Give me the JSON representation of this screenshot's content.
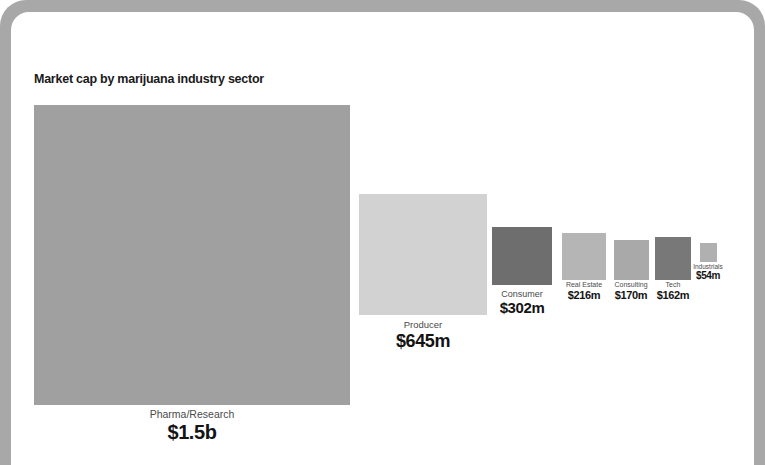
{
  "chart_data": {
    "type": "treemap",
    "title": "Market cap by marijuana industry sector",
    "xlabel": "",
    "ylabel": "",
    "grid": false,
    "legend": "none",
    "unit": "USD market capitalization",
    "categories": [
      "Pharma/Research",
      "Producer",
      "Consumer",
      "Real Estate",
      "Consulting",
      "Tech",
      "Industrials"
    ],
    "values": [
      1500,
      645,
      302,
      216,
      170,
      162,
      54
    ],
    "value_labels": [
      "$1.5b",
      "$645m",
      "$302m",
      "$216m",
      "$170m",
      "$162m",
      "$54m"
    ],
    "items": [
      {
        "label": "Pharma/Research",
        "value_label": "$1.5b",
        "value": 1500,
        "color": "#a0a0a0",
        "box": {
          "x": 34,
          "y": 105,
          "w": 316,
          "h": 300
        },
        "label_center_x": 192,
        "label_top": 408,
        "tier": "t-xl"
      },
      {
        "label": "Producer",
        "value_label": "$645m",
        "value": 645,
        "color": "#d2d2d2",
        "box": {
          "x": 359,
          "y": 194,
          "w": 128,
          "h": 121
        },
        "label_center_x": 423,
        "label_top": 320,
        "tier": "t-lg"
      },
      {
        "label": "Consumer",
        "value_label": "$302m",
        "value": 302,
        "color": "#6e6e6e",
        "box": {
          "x": 492,
          "y": 227,
          "w": 60,
          "h": 58
        },
        "label_center_x": 522,
        "label_top": 289,
        "tier": "t-md"
      },
      {
        "label": "Real Estate",
        "value_label": "$216m",
        "value": 216,
        "color": "#b5b5b5",
        "box": {
          "x": 562,
          "y": 233,
          "w": 44,
          "h": 47
        },
        "label_center_x": 584,
        "label_top": 281,
        "tier": "t-sm"
      },
      {
        "label": "Consulting",
        "value_label": "$170m",
        "value": 170,
        "color": "#a9a9a9",
        "box": {
          "x": 614,
          "y": 240,
          "w": 35,
          "h": 40
        },
        "label_center_x": 631,
        "label_top": 281,
        "tier": "t-sm"
      },
      {
        "label": "Tech",
        "value_label": "$162m",
        "value": 162,
        "color": "#787878",
        "box": {
          "x": 655,
          "y": 237,
          "w": 36,
          "h": 43
        },
        "label_center_x": 673,
        "label_top": 281,
        "tier": "t-sm"
      },
      {
        "label": "Industrials",
        "value_label": "$54m",
        "value": 54,
        "color": "#b0b0b0",
        "box": {
          "x": 700,
          "y": 243,
          "w": 17,
          "h": 19
        },
        "label_center_x": 708,
        "label_top": 263,
        "tier": "t-xs"
      }
    ]
  },
  "frame": {
    "bezel_color": "#a8a8a8",
    "screen_color": "#ffffff"
  },
  "colors": {
    "title": "#1a1a1a",
    "label": "#4a4a4a",
    "value": "#141414"
  }
}
